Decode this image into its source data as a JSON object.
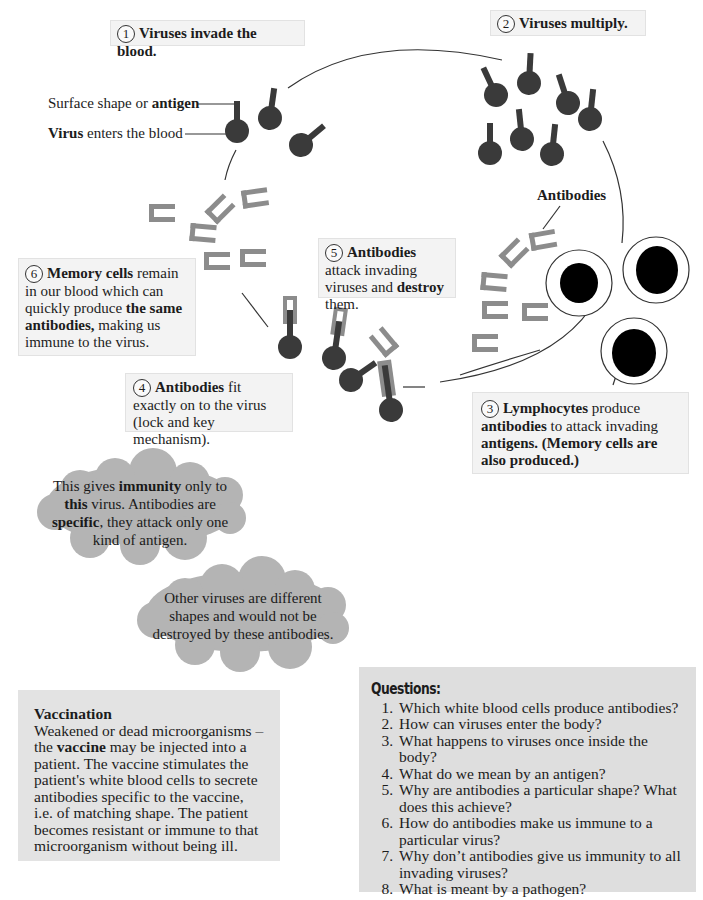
{
  "diagram": {
    "colors": {
      "virus": "#3a3a3a",
      "antibody": "#8c8c8c",
      "lymphocyte_nucleus": "#000000",
      "box_bg": "#f3f3f3",
      "cloud_bg": "#b4b4b4",
      "panel_bg": "#e3e3e3"
    },
    "steps": [
      {
        "number": "1",
        "bold": "Viruses invade the blood.",
        "text": ""
      },
      {
        "number": "2",
        "bold": "Viruses multiply.",
        "text": ""
      },
      {
        "number": "3",
        "bold_1": "Lymphocytes",
        "text_1": " produce ",
        "bold_2": "antibodies",
        "text_2": " to attack invading ",
        "bold_3": "antigens. (Memory cells are also produced.)"
      },
      {
        "number": "4",
        "bold_1": "Antibodies",
        "text_1": " fit exactly on to the virus (lock and key mechanism)."
      },
      {
        "number": "5",
        "bold_1": "Antibodies",
        "text_1": " attack invading viruses and ",
        "bold_2": "destroy",
        "text_2": " them."
      },
      {
        "number": "6",
        "bold_1": "Memory cells",
        "text_1": " remain in our blood which can quickly produce ",
        "bold_2": "the same antibodies,",
        "text_2": " making us immune to the virus."
      }
    ],
    "labels": {
      "antigen_prefix": "Surface shape or ",
      "antigen_bold": "antigen",
      "virus_bold": "Virus",
      "virus_suffix": " enters the blood",
      "antibodies": "Antibodies"
    }
  },
  "clouds": [
    {
      "t1": "This gives ",
      "b1": "immunity",
      "t2": " only to ",
      "b2": "this",
      "t3": " virus. Antibodies are ",
      "b3": "specific",
      "t4": ", they attack only one kind of antigen."
    },
    {
      "text": "Other viruses are different shapes and would not be destroyed by these antibodies."
    }
  ],
  "vaccination": {
    "title": "Vaccination",
    "t1": "Weakened or dead microorganisms – the ",
    "b1": "vaccine",
    "t2": " may be injected into a patient. The vaccine stimulates the patient's white blood cells to secrete antibodies specific to the vaccine, i.e. of matching shape. The patient becomes resistant or immune to that microorganism without being ill."
  },
  "questions": {
    "title": "Questions:",
    "items": [
      "Which white blood cells produce antibodies?",
      "How can viruses enter the body?",
      "What happens to viruses once inside the body?",
      "What do we mean by an antigen?",
      "Why are antibodies a particular shape? What does this achieve?",
      "How do antibodies make us immune to a particular virus?",
      "Why don’t antibodies give us immunity to all invading viruses?",
      "What is meant by a pathogen?"
    ]
  }
}
